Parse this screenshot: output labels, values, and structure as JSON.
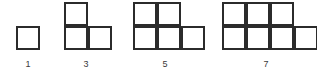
{
  "figure": {
    "background_color": "#ffffff",
    "stroke_color": "#2b2b2b",
    "label_color": "#3a3a3a",
    "cell_size_px": 24,
    "stroke_width_px": 2,
    "baseline_y_px": 50
  },
  "chart_data": {
    "type": "table",
    "categories": [
      "1",
      "2",
      "3",
      "4"
    ],
    "values": [
      1,
      3,
      5,
      7
    ],
    "labels": [
      "1",
      "3",
      "5",
      "7"
    ],
    "xlabel": "",
    "ylabel": ""
  },
  "figures": [
    {
      "id": "figure-1",
      "label": "1",
      "square_count": 1,
      "top_row_count": 0,
      "bottom_row_count": 1,
      "origin_x": 16,
      "label_x": 18,
      "cells": [
        {
          "name": "cell-r2-c1",
          "col": 0,
          "row": 1
        }
      ]
    },
    {
      "id": "figure-2",
      "label": "3",
      "square_count": 3,
      "top_row_count": 1,
      "bottom_row_count": 2,
      "origin_x": 64,
      "label_x": 76,
      "cells": [
        {
          "name": "cell-r1-c1",
          "col": 0,
          "row": 0
        },
        {
          "name": "cell-r2-c1",
          "col": 0,
          "row": 1
        },
        {
          "name": "cell-r2-c2",
          "col": 1,
          "row": 1
        }
      ]
    },
    {
      "id": "figure-3",
      "label": "5",
      "square_count": 5,
      "top_row_count": 2,
      "bottom_row_count": 3,
      "origin_x": 133,
      "label_x": 155,
      "cells": [
        {
          "name": "cell-r1-c1",
          "col": 0,
          "row": 0
        },
        {
          "name": "cell-r1-c2",
          "col": 1,
          "row": 0
        },
        {
          "name": "cell-r2-c1",
          "col": 0,
          "row": 1
        },
        {
          "name": "cell-r2-c2",
          "col": 1,
          "row": 1
        },
        {
          "name": "cell-r2-c3",
          "col": 2,
          "row": 1
        }
      ]
    },
    {
      "id": "figure-4",
      "label": "7",
      "square_count": 7,
      "top_row_count": 3,
      "bottom_row_count": 4,
      "origin_x": 222,
      "label_x": 256,
      "cells": [
        {
          "name": "cell-r1-c1",
          "col": 0,
          "row": 0
        },
        {
          "name": "cell-r1-c2",
          "col": 1,
          "row": 0
        },
        {
          "name": "cell-r1-c3",
          "col": 2,
          "row": 0
        },
        {
          "name": "cell-r2-c1",
          "col": 0,
          "row": 1
        },
        {
          "name": "cell-r2-c2",
          "col": 1,
          "row": 1
        },
        {
          "name": "cell-r2-c3",
          "col": 2,
          "row": 1
        },
        {
          "name": "cell-r2-c4",
          "col": 3,
          "row": 1
        }
      ]
    }
  ]
}
